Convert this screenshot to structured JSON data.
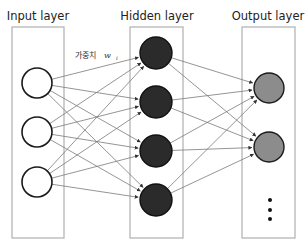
{
  "diagram": {
    "type": "neural-network",
    "layers": [
      {
        "id": "input",
        "title": "Input layer",
        "node_count": 3,
        "node_style": "hollow",
        "node_color": "#ffffff",
        "ellipsis": false
      },
      {
        "id": "hidden",
        "title": "Hidden layer",
        "node_count": 4,
        "node_style": "filled",
        "node_color": "#2b2b2b",
        "ellipsis": false
      },
      {
        "id": "output",
        "title": "Output layer",
        "node_count": 2,
        "node_style": "filled",
        "node_color": "#8c8c8c",
        "ellipsis": true
      }
    ],
    "connections": "fully-connected",
    "weight_label": {
      "text": "가중치",
      "symbol": "w",
      "subscript": "i"
    },
    "colors": {
      "box_border": "#b0b0b0",
      "edge": "#7a7a7a",
      "node_outline": "#1a1a1a"
    }
  }
}
